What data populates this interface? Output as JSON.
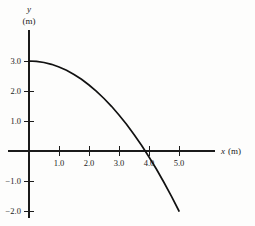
{
  "chart_data": {
    "type": "line",
    "title": "",
    "subtitle": "",
    "xlabel": "x (m)",
    "ylabel": "y (m)",
    "xlabel_variable": "x",
    "xlabel_unit": "(m)",
    "ylabel_variable": "y",
    "ylabel_unit": "(m)",
    "xlim": [
      -0.35,
      6.2
    ],
    "ylim": [
      -2.35,
      4.05
    ],
    "grid": false,
    "legend": null,
    "x_ticks": [
      1.0,
      2.0,
      3.0,
      4.0,
      5.0
    ],
    "x_tick_labels": [
      "1.0",
      "2.0",
      "3.0",
      "4.0",
      "5.0"
    ],
    "y_ticks": [
      3.0,
      2.0,
      1.0,
      -1.0,
      -2.0
    ],
    "y_tick_labels": [
      "3.0",
      "2.0",
      "1.0",
      "−1.0",
      "−2.0"
    ],
    "series": [
      {
        "name": "trajectory",
        "equation": "y = 3.0 - 0.2 x^2",
        "color": "#111111",
        "x": [
          0.0,
          0.25,
          0.5,
          0.75,
          1.0,
          1.25,
          1.5,
          1.75,
          2.0,
          2.25,
          2.5,
          2.75,
          3.0,
          3.25,
          3.5,
          3.75,
          3.873,
          4.0,
          4.25,
          4.5,
          4.75,
          5.0
        ],
        "y": [
          3.0,
          2.99,
          2.95,
          2.89,
          2.8,
          2.69,
          2.55,
          2.39,
          2.2,
          1.99,
          1.75,
          1.49,
          1.2,
          0.89,
          0.55,
          0.19,
          0.0,
          -0.2,
          -0.61,
          -1.05,
          -1.51,
          -2.0
        ]
      }
    ],
    "x_zero_crossing": 3.87,
    "y_intercept": 3.0,
    "axis_color": "#1b1b1b"
  },
  "figure": {
    "background": "#fdfdfc"
  }
}
